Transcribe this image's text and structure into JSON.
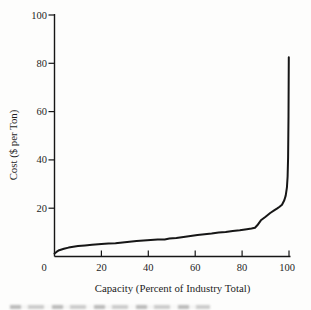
{
  "figure": {
    "background_color": "#fdfdfc",
    "ink_color": "#161616"
  },
  "chart_data": {
    "type": "line",
    "title": "",
    "xlabel": "Capacity (Percent of Industry Total)",
    "ylabel": "Cost ($ per Ton)",
    "xlim": [
      0,
      100
    ],
    "ylim": [
      0,
      100
    ],
    "grid": false,
    "legend": null,
    "x_ticks": [
      "0",
      "20",
      "40",
      "60",
      "80",
      "100"
    ],
    "y_ticks": [
      "20",
      "40",
      "60",
      "80",
      "100"
    ],
    "series": [
      {
        "name": "industry-cost-supply-curve",
        "color": "#161616",
        "points": [
          [
            0,
            1.2
          ],
          [
            1,
            2.0
          ],
          [
            2,
            2.6
          ],
          [
            4,
            3.2
          ],
          [
            6,
            3.7
          ],
          [
            8,
            4.0
          ],
          [
            10,
            4.3
          ],
          [
            13,
            4.6
          ],
          [
            16,
            4.9
          ],
          [
            20,
            5.2
          ],
          [
            23,
            5.4
          ],
          [
            26,
            5.5
          ],
          [
            29,
            5.8
          ],
          [
            32,
            6.1
          ],
          [
            35,
            6.4
          ],
          [
            38,
            6.6
          ],
          [
            41,
            6.8
          ],
          [
            44,
            7.0
          ],
          [
            47,
            7.1
          ],
          [
            49,
            7.4
          ],
          [
            52,
            7.7
          ],
          [
            55,
            8.1
          ],
          [
            58,
            8.5
          ],
          [
            61,
            8.9
          ],
          [
            64,
            9.2
          ],
          [
            67,
            9.5
          ],
          [
            70,
            9.9
          ],
          [
            73,
            10.2
          ],
          [
            76,
            10.6
          ],
          [
            79,
            10.9
          ],
          [
            82,
            11.3
          ],
          [
            84,
            11.6
          ],
          [
            85.5,
            11.9
          ],
          [
            86.5,
            12.9
          ],
          [
            88,
            15.0
          ],
          [
            90,
            16.5
          ],
          [
            92,
            18.0
          ],
          [
            94,
            19.3
          ],
          [
            95,
            19.9
          ],
          [
            96,
            20.6
          ],
          [
            97,
            21.4
          ],
          [
            98,
            23.3
          ],
          [
            98.6,
            25.2
          ],
          [
            99.1,
            28.5
          ],
          [
            99.4,
            33.0
          ],
          [
            99.6,
            41.0
          ],
          [
            99.8,
            58.0
          ],
          [
            99.9,
            82.5
          ]
        ]
      }
    ]
  }
}
